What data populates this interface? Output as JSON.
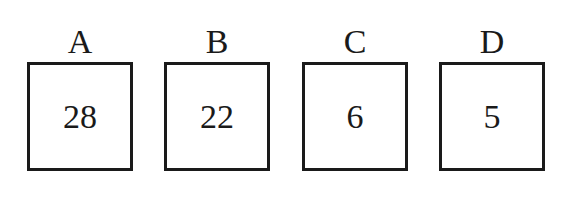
{
  "diagram": {
    "boxes": [
      {
        "label": "A",
        "value": "28"
      },
      {
        "label": "B",
        "value": "22"
      },
      {
        "label": "C",
        "value": "6"
      },
      {
        "label": "D",
        "value": "5"
      }
    ]
  }
}
